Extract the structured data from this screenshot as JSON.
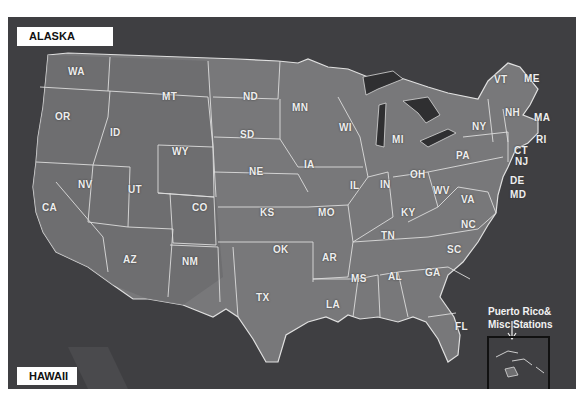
{
  "map": {
    "background_color": "#3f3f42",
    "land_color": "#7a7a7c",
    "border_color": "#dcdcdc",
    "insets": {
      "alaska_label": "ALASKA",
      "hawaii_label": "HAWAII",
      "puerto_rico_line1": "Puerto Rico&",
      "puerto_rico_line2": "Misc Stations"
    },
    "states": [
      {
        "code": "WA",
        "x": 68,
        "y": 72
      },
      {
        "code": "OR",
        "x": 55,
        "y": 117
      },
      {
        "code": "ID",
        "x": 110,
        "y": 133
      },
      {
        "code": "MT",
        "x": 162,
        "y": 97
      },
      {
        "code": "WY",
        "x": 172,
        "y": 152
      },
      {
        "code": "NV",
        "x": 78,
        "y": 185
      },
      {
        "code": "UT",
        "x": 128,
        "y": 190
      },
      {
        "code": "CA",
        "x": 42,
        "y": 208
      },
      {
        "code": "CO",
        "x": 192,
        "y": 208
      },
      {
        "code": "AZ",
        "x": 123,
        "y": 260
      },
      {
        "code": "NM",
        "x": 182,
        "y": 262
      },
      {
        "code": "ND",
        "x": 243,
        "y": 97
      },
      {
        "code": "SD",
        "x": 240,
        "y": 135
      },
      {
        "code": "NE",
        "x": 249,
        "y": 172
      },
      {
        "code": "KS",
        "x": 260,
        "y": 213
      },
      {
        "code": "OK",
        "x": 273,
        "y": 250
      },
      {
        "code": "TX",
        "x": 256,
        "y": 298
      },
      {
        "code": "MN",
        "x": 292,
        "y": 108
      },
      {
        "code": "IA",
        "x": 304,
        "y": 165
      },
      {
        "code": "MO",
        "x": 318,
        "y": 213
      },
      {
        "code": "AR",
        "x": 322,
        "y": 258
      },
      {
        "code": "LA",
        "x": 326,
        "y": 305
      },
      {
        "code": "WI",
        "x": 339,
        "y": 128
      },
      {
        "code": "IL",
        "x": 350,
        "y": 186
      },
      {
        "code": "MI",
        "x": 392,
        "y": 140
      },
      {
        "code": "IN",
        "x": 380,
        "y": 185
      },
      {
        "code": "OH",
        "x": 410,
        "y": 175
      },
      {
        "code": "KY",
        "x": 401,
        "y": 213
      },
      {
        "code": "TN",
        "x": 381,
        "y": 236
      },
      {
        "code": "MS",
        "x": 351,
        "y": 279
      },
      {
        "code": "AL",
        "x": 388,
        "y": 277
      },
      {
        "code": "GA",
        "x": 425,
        "y": 273
      },
      {
        "code": "FL",
        "x": 455,
        "y": 327
      },
      {
        "code": "SC",
        "x": 447,
        "y": 250
      },
      {
        "code": "NC",
        "x": 461,
        "y": 225
      },
      {
        "code": "VA",
        "x": 461,
        "y": 200
      },
      {
        "code": "WV",
        "x": 433,
        "y": 191
      },
      {
        "code": "PA",
        "x": 456,
        "y": 156
      },
      {
        "code": "NY",
        "x": 472,
        "y": 127
      },
      {
        "code": "VT",
        "x": 494,
        "y": 80
      },
      {
        "code": "ME",
        "x": 524,
        "y": 79
      },
      {
        "code": "NH",
        "x": 505,
        "y": 113
      },
      {
        "code": "MA",
        "x": 534,
        "y": 118
      },
      {
        "code": "RI",
        "x": 536,
        "y": 140
      },
      {
        "code": "CT",
        "x": 514,
        "y": 151
      },
      {
        "code": "NJ",
        "x": 515,
        "y": 162
      },
      {
        "code": "DE",
        "x": 510,
        "y": 181
      },
      {
        "code": "MD",
        "x": 510,
        "y": 195
      }
    ],
    "copyright": "COPYRIGHT © 1996 by RAY STERNER, JOHNS HOPKINS UNIVERSITY APPLIED PHYSICS LABORATORY"
  }
}
